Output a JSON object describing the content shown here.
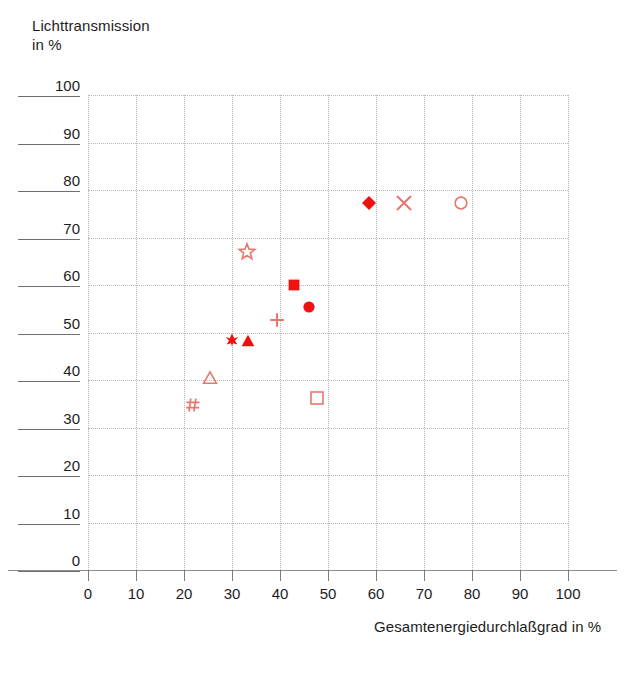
{
  "chart_data": {
    "type": "scatter",
    "title": "",
    "xlabel": "Gesamtenergiedurchlaßgrad in %",
    "ylabel": "Lichttransmission\nin %",
    "xlim": [
      0,
      100
    ],
    "ylim": [
      0,
      100
    ],
    "xticks": [
      0,
      10,
      20,
      30,
      40,
      50,
      60,
      70,
      80,
      90,
      100
    ],
    "yticks": [
      0,
      10,
      20,
      30,
      40,
      50,
      60,
      70,
      80,
      90,
      100
    ],
    "xtick_labels": [
      "0",
      "10",
      "20",
      "30",
      "40",
      "50",
      "60",
      "70",
      "80",
      "90",
      "100"
    ],
    "ytick_labels": [
      "0",
      "10",
      "20",
      "30",
      "40",
      "50",
      "60",
      "70",
      "80",
      "90",
      "100"
    ],
    "grid": true,
    "grid_style": "dotted",
    "grid_color": "#b9b9b9",
    "legend": "none",
    "marker_color_filled": "#f01010",
    "marker_color_open": "#e8776e",
    "points": [
      {
        "name": "hash",
        "marker": "hash",
        "fill": "open",
        "x": 21.9,
        "y": 34.7
      },
      {
        "name": "open-triangle",
        "marker": "triangle-up",
        "fill": "open",
        "x": 25.4,
        "y": 40.4
      },
      {
        "name": "pinwheel",
        "marker": "pinwheel",
        "fill": "filled",
        "x": 30.0,
        "y": 48.4
      },
      {
        "name": "filled-triangle",
        "marker": "triangle-up",
        "fill": "filled",
        "x": 33.3,
        "y": 48.2
      },
      {
        "name": "open-star",
        "marker": "star",
        "fill": "open",
        "x": 33.1,
        "y": 66.9
      },
      {
        "name": "plus",
        "marker": "plus",
        "fill": "open",
        "x": 39.4,
        "y": 52.6
      },
      {
        "name": "filled-square",
        "marker": "square",
        "fill": "filled",
        "x": 42.9,
        "y": 60.0
      },
      {
        "name": "filled-circle",
        "marker": "circle",
        "fill": "filled",
        "x": 46.0,
        "y": 55.4
      },
      {
        "name": "open-square",
        "marker": "square",
        "fill": "open",
        "x": 47.7,
        "y": 36.2
      },
      {
        "name": "filled-diamond",
        "marker": "diamond",
        "fill": "filled",
        "x": 58.5,
        "y": 77.3
      },
      {
        "name": "cross-x",
        "marker": "x",
        "fill": "open",
        "x": 65.8,
        "y": 77.3
      },
      {
        "name": "open-circle",
        "marker": "circle",
        "fill": "open",
        "x": 77.7,
        "y": 77.3
      }
    ]
  }
}
